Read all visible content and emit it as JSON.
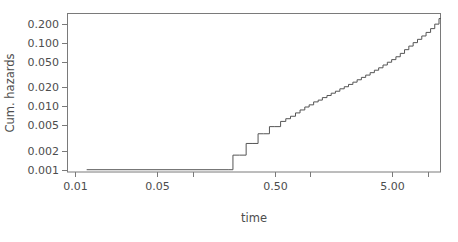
{
  "figure": {
    "background_color": "#ffffff",
    "plot_area": {
      "left": 67,
      "top": 13,
      "right": 441,
      "bottom": 172
    },
    "frame_color": "#7a7a7a",
    "line_color": "#555555",
    "text_color": "#4d4d4d"
  },
  "chart_data": {
    "type": "line",
    "title": "",
    "subtitle": "",
    "xlabel": "time",
    "ylabel": "Cum. hazards",
    "xscale": "log",
    "yscale": "log",
    "grid": false,
    "legend": null,
    "xlim": [
      0.0085,
      13.0
    ],
    "ylim": [
      0.00092,
      0.3
    ],
    "xticks": [
      0.01,
      0.05,
      0.5,
      5.0
    ],
    "xtick_labels": [
      "0.01",
      "0.05",
      "0.50",
      "5.00"
    ],
    "xticks_unlabeled": [
      0.1,
      1.0,
      10.0
    ],
    "yticks": [
      0.001,
      0.002,
      0.005,
      0.01,
      0.02,
      0.05,
      0.1,
      0.2
    ],
    "ytick_labels": [
      "0.001",
      "0.002",
      "0.005",
      "0.010",
      "0.020",
      "0.050",
      "0.100",
      "0.200"
    ],
    "series": [
      {
        "name": "cumulative hazard",
        "step": "post",
        "x": [
          0.0125,
          0.2,
          0.22,
          0.25,
          0.285,
          0.32,
          0.36,
          0.4,
          0.45,
          0.5,
          0.56,
          0.62,
          0.68,
          0.75,
          0.82,
          0.9,
          0.98,
          1.07,
          1.17,
          1.27,
          1.39,
          1.51,
          1.64,
          1.79,
          1.95,
          2.12,
          2.31,
          2.51,
          2.73,
          2.97,
          3.24,
          3.52,
          3.83,
          4.17,
          4.54,
          4.94,
          5.37,
          5.85,
          6.36,
          6.92,
          7.53,
          8.2,
          8.92,
          9.7,
          10.6,
          11.5,
          12.5
        ],
        "y": [
          0.001,
          0.001,
          0.0017,
          0.0017,
          0.0026,
          0.0026,
          0.0037,
          0.0037,
          0.0048,
          0.0048,
          0.0058,
          0.0064,
          0.007,
          0.0079,
          0.0088,
          0.0098,
          0.0106,
          0.0118,
          0.0126,
          0.0138,
          0.0149,
          0.0162,
          0.0174,
          0.019,
          0.0205,
          0.0223,
          0.0242,
          0.0264,
          0.0288,
          0.0313,
          0.0342,
          0.0374,
          0.0408,
          0.0452,
          0.05,
          0.055,
          0.061,
          0.069,
          0.079,
          0.09,
          0.102,
          0.115,
          0.13,
          0.148,
          0.17,
          0.2,
          0.245
        ],
        "baseline_value": 0.001,
        "baseline_x_start": 0.0125,
        "baseline_x_end": 0.205,
        "final_value": 0.245
      }
    ],
    "annotations": []
  }
}
